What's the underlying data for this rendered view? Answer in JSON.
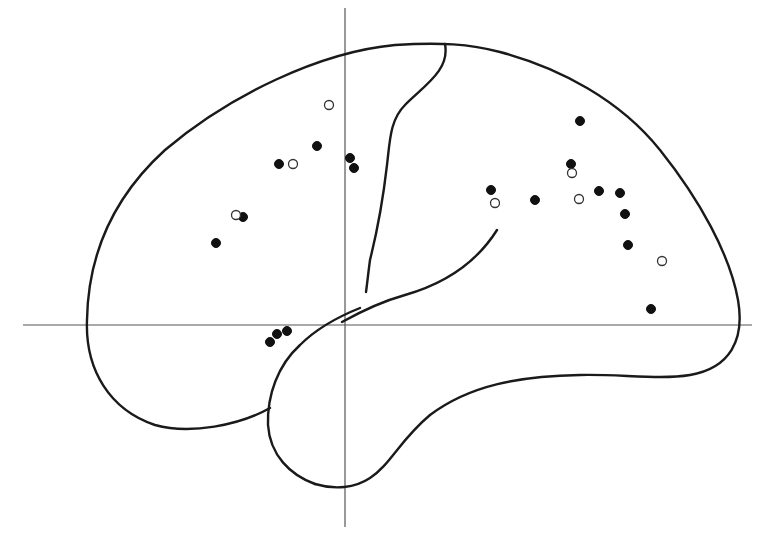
{
  "diagram": {
    "title": "",
    "type": "lateral brain outline with coordinate axes",
    "colors": {
      "background": "#ffffff",
      "outline": "#1a1a1a",
      "axis": "#555555",
      "filled_marker": "#111111",
      "open_marker_stroke": "#333333"
    },
    "axes": {
      "vertical": {
        "x": 345,
        "y1": 8,
        "y2": 527
      },
      "horizontal": {
        "y": 325,
        "x1": 23,
        "x2": 752
      }
    },
    "marker_radius": 4.5,
    "markers": {
      "filled": [
        [
          279,
          164
        ],
        [
          317,
          146
        ],
        [
          350,
          158
        ],
        [
          354,
          168
        ],
        [
          243,
          217
        ],
        [
          216,
          243
        ],
        [
          580,
          121
        ],
        [
          571,
          164
        ],
        [
          491,
          190
        ],
        [
          535,
          200
        ],
        [
          599,
          191
        ],
        [
          620,
          193
        ],
        [
          625,
          214
        ],
        [
          628,
          245
        ],
        [
          651,
          309
        ],
        [
          287,
          331
        ],
        [
          277,
          334
        ],
        [
          270,
          342
        ]
      ],
      "open": [
        [
          329,
          105
        ],
        [
          293,
          164
        ],
        [
          236,
          215
        ],
        [
          572,
          173
        ],
        [
          495,
          203
        ],
        [
          579,
          199
        ],
        [
          662,
          261
        ]
      ]
    },
    "legend": []
  }
}
